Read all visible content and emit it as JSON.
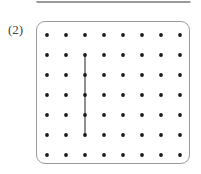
{
  "figure": {
    "label": "(2)",
    "kind": "dot-grid-geoboard",
    "colors": {
      "dot": "#1a1a1a",
      "panel_border": "#9b9b9b",
      "segment": "#333333",
      "background": "#ffffff",
      "prev_box_edge": "#9a9a9a"
    },
    "panel": {
      "x": 36,
      "y": 21,
      "width": 154,
      "height": 143,
      "corner_radius": 9
    }
  },
  "chart_data": {
    "type": "scatter",
    "title": "(2)",
    "xlabel": "",
    "ylabel": "",
    "grid": false,
    "legend": false,
    "columns": 8,
    "rows": 7,
    "dot_radius": 1.9,
    "origin": {
      "x": 10,
      "y": 13
    },
    "spacing": {
      "x": 19,
      "y": 20
    },
    "x": [
      0,
      1,
      2,
      3,
      4,
      5,
      6,
      7
    ],
    "y": [
      0,
      1,
      2,
      3,
      4,
      5,
      6
    ],
    "points": [
      [
        0,
        0
      ],
      [
        1,
        0
      ],
      [
        2,
        0
      ],
      [
        3,
        0
      ],
      [
        4,
        0
      ],
      [
        5,
        0
      ],
      [
        6,
        0
      ],
      [
        7,
        0
      ],
      [
        0,
        1
      ],
      [
        1,
        1
      ],
      [
        2,
        1
      ],
      [
        3,
        1
      ],
      [
        4,
        1
      ],
      [
        5,
        1
      ],
      [
        6,
        1
      ],
      [
        7,
        1
      ],
      [
        0,
        2
      ],
      [
        1,
        2
      ],
      [
        2,
        2
      ],
      [
        3,
        2
      ],
      [
        4,
        2
      ],
      [
        5,
        2
      ],
      [
        6,
        2
      ],
      [
        7,
        2
      ],
      [
        0,
        3
      ],
      [
        1,
        3
      ],
      [
        2,
        3
      ],
      [
        3,
        3
      ],
      [
        4,
        3
      ],
      [
        5,
        3
      ],
      [
        6,
        3
      ],
      [
        7,
        3
      ],
      [
        0,
        4
      ],
      [
        1,
        4
      ],
      [
        2,
        4
      ],
      [
        3,
        4
      ],
      [
        4,
        4
      ],
      [
        5,
        4
      ],
      [
        6,
        4
      ],
      [
        7,
        4
      ],
      [
        0,
        5
      ],
      [
        1,
        5
      ],
      [
        2,
        5
      ],
      [
        3,
        5
      ],
      [
        4,
        5
      ],
      [
        5,
        5
      ],
      [
        6,
        5
      ],
      [
        7,
        5
      ],
      [
        0,
        6
      ],
      [
        1,
        6
      ],
      [
        2,
        6
      ],
      [
        3,
        6
      ],
      [
        4,
        6
      ],
      [
        5,
        6
      ],
      [
        6,
        6
      ],
      [
        7,
        6
      ]
    ],
    "segments": [
      {
        "name": "vertical-segment",
        "from": [
          2,
          1
        ],
        "to": [
          2,
          5
        ]
      }
    ],
    "annotations": []
  }
}
